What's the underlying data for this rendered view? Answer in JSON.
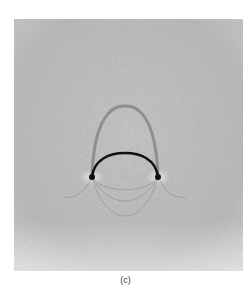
{
  "figure": {
    "caption": "(c)",
    "colors": {
      "background": "#ffffff",
      "photo_base": "#bdbdbd",
      "wire": "#111111",
      "shadow": "#7a7a7a"
    }
  }
}
